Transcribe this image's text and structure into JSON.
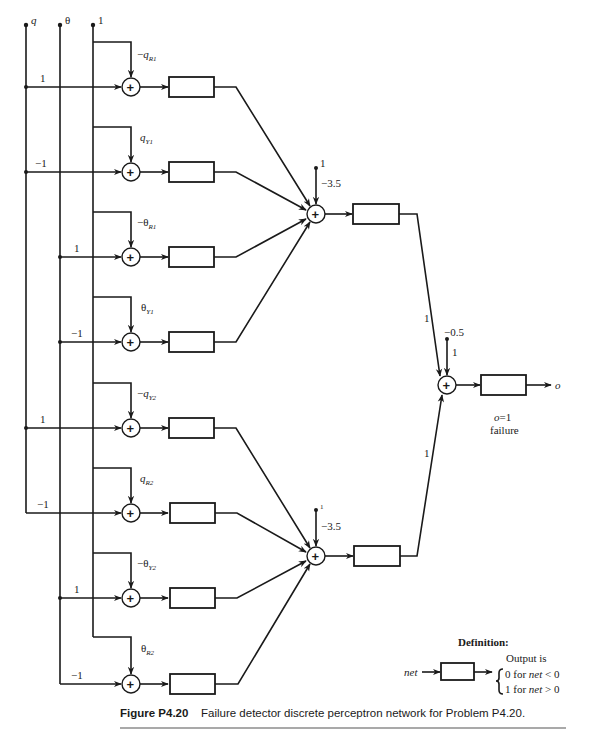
{
  "figure": {
    "number": "Figure P4.20",
    "caption": "Failure detector discrete perceptron network for Problem P4.20."
  },
  "inputs": {
    "q": "q",
    "theta": "θ",
    "one": "1"
  },
  "first_layer": [
    {
      "row": 1,
      "input_weight": "1",
      "bias_sign": "−",
      "bias_var": "q",
      "bias_sub": "R1"
    },
    {
      "row": 2,
      "input_weight": "−1",
      "bias_sign": "",
      "bias_var": "q",
      "bias_sub": "Y1"
    },
    {
      "row": 3,
      "input_weight": "1",
      "bias_sign": "−",
      "bias_var": "θ",
      "bias_sub": "R1"
    },
    {
      "row": 4,
      "input_weight": "−1",
      "bias_sign": "",
      "bias_var": "θ",
      "bias_sub": "Y1"
    },
    {
      "row": 5,
      "input_weight": "1",
      "bias_sign": "−",
      "bias_var": "q",
      "bias_sub": "Y2"
    },
    {
      "row": 6,
      "input_weight": "−1",
      "bias_sign": "",
      "bias_var": "q",
      "bias_sub": "R2"
    },
    {
      "row": 7,
      "input_weight": "1",
      "bias_sign": "−",
      "bias_var": "θ",
      "bias_sub": "Y2"
    },
    {
      "row": 8,
      "input_weight": "−1",
      "bias_sign": "",
      "bias_var": "θ",
      "bias_sub": "R2"
    }
  ],
  "hidden_layer": [
    {
      "bias_input": "1",
      "bias_weight": "−3.5"
    },
    {
      "bias_input": "1",
      "bias_weight": "−3.5"
    }
  ],
  "output_layer": {
    "bias_input": "−0.5",
    "bias_weight": "1",
    "weight_from_hidden_1": "1",
    "weight_from_hidden_2": "1",
    "output_label": "o",
    "note_line1": "o=1",
    "note_line2": "failure"
  },
  "definition": {
    "title": "Definition:",
    "input_label": "net",
    "output_heading": "Output is",
    "case_0": "0 for net < 0",
    "case_1": "1 for net > 0"
  }
}
